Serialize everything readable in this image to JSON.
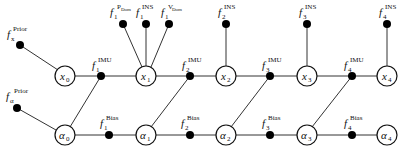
{
  "diagram": {
    "type": "factor-graph",
    "state_nodes": [
      {
        "id": "x0",
        "base": "x",
        "sub": "0"
      },
      {
        "id": "x1",
        "base": "x",
        "sub": "1"
      },
      {
        "id": "x2",
        "base": "x",
        "sub": "2"
      },
      {
        "id": "x3",
        "base": "x",
        "sub": "3"
      },
      {
        "id": "x4",
        "base": "x",
        "sub": "4"
      }
    ],
    "bias_nodes": [
      {
        "id": "a0",
        "base": "α",
        "sub": "0"
      },
      {
        "id": "a1",
        "base": "α",
        "sub": "1"
      },
      {
        "id": "a2",
        "base": "α",
        "sub": "2"
      },
      {
        "id": "a3",
        "base": "α",
        "sub": "3"
      },
      {
        "id": "a4",
        "base": "α",
        "sub": "4"
      }
    ],
    "prior_factors": [
      {
        "base": "f",
        "sub": "x",
        "sup": "Prior"
      },
      {
        "base": "f",
        "sub": "α",
        "sup": "Prior"
      }
    ],
    "imu_factors": [
      {
        "base": "f",
        "sub": "1",
        "sup": "IMU"
      },
      {
        "base": "f",
        "sub": "2",
        "sup": "IMU"
      },
      {
        "base": "f",
        "sub": "3",
        "sup": "IMU"
      },
      {
        "base": "f",
        "sub": "4",
        "sup": "IMU"
      }
    ],
    "bias_factors": [
      {
        "base": "f",
        "sub": "1",
        "sup": "Bias"
      },
      {
        "base": "f",
        "sub": "2",
        "sup": "Bias"
      },
      {
        "base": "f",
        "sub": "3",
        "sup": "Bias"
      },
      {
        "base": "f",
        "sub": "4",
        "sup": "Bias"
      }
    ],
    "measurement_factors": [
      {
        "base": "f",
        "sub": "1",
        "sup": "P",
        "sup_sub": "Dom"
      },
      {
        "base": "f",
        "sub": "1",
        "sup": "INS"
      },
      {
        "base": "f",
        "sub": "1",
        "sup": "V",
        "sup_sub": "Dom"
      },
      {
        "base": "f",
        "sub": "2",
        "sup": "INS"
      },
      {
        "base": "f",
        "sub": "3",
        "sup": "INS"
      },
      {
        "base": "f",
        "sub": "4",
        "sup": "INS"
      }
    ]
  }
}
